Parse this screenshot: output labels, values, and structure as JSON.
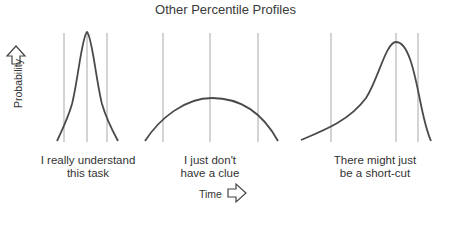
{
  "title": "Other Percentile Profiles",
  "axes": {
    "y_label": "Probability",
    "y_arrow_icon": "up-arrow-outline",
    "x_label": "Time",
    "x_arrow_icon": "right-arrow-outline"
  },
  "colors": {
    "curve": "#4a4a4a",
    "percentile_line": "#a8a8a8",
    "text": "#333333"
  },
  "panels": [
    {
      "id": "narrow",
      "caption_line1": "I really understand",
      "caption_line2": "this task",
      "shape": "narrow symmetric peak",
      "percentile_lines_x": [
        64,
        87,
        107
      ]
    },
    {
      "id": "flat",
      "caption_line1": "I just don't",
      "caption_line2": "have a clue",
      "shape": "wide flat arc",
      "percentile_lines_x": [
        163,
        210,
        258
      ]
    },
    {
      "id": "skewed",
      "caption_line1": "There might just",
      "caption_line2": "be a short-cut",
      "shape": "left-skewed peak with long left tail",
      "percentile_lines_x": [
        331,
        396,
        418
      ]
    }
  ]
}
